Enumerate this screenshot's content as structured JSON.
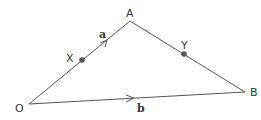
{
  "diagram": {
    "type": "vector-triangle",
    "points": {
      "O": {
        "label": "O",
        "x": 29,
        "y": 104
      },
      "A": {
        "label": "A",
        "x": 130,
        "y": 21
      },
      "B": {
        "label": "B",
        "x": 245,
        "y": 92
      },
      "X": {
        "label": "X",
        "x": 82,
        "y": 60
      },
      "Y": {
        "label": "Y",
        "x": 184,
        "y": 54
      }
    },
    "vectors": {
      "a": {
        "label": "a",
        "from": "O",
        "to": "A"
      },
      "b": {
        "label": "b",
        "from": "O",
        "to": "B"
      }
    },
    "colors": {
      "line": "#555555",
      "dot": "#555555",
      "text": "#333333"
    }
  }
}
